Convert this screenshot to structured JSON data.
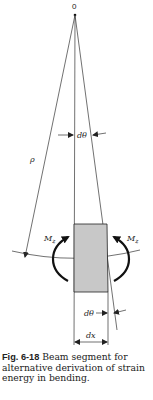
{
  "diagram": {
    "labels": {
      "origin": "0",
      "radius": "ρ",
      "angle_top": "dθ",
      "angle_bottom": "dθ",
      "moment_left": "M",
      "moment_left_sub": "z",
      "moment_right": "M",
      "moment_right_sub": "z",
      "segment_length": "dx"
    },
    "colors": {
      "segment_fill": "#c8c8c8",
      "line": "#333333"
    }
  },
  "caption": {
    "number": "Fig. 6-18",
    "text": " Beam segment for alternative derivation of strain energy in bending."
  }
}
